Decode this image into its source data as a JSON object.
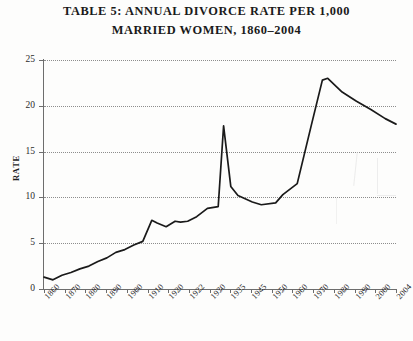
{
  "figure": {
    "title_line1": "Table 5: Annual Divorce Rate per 1,000",
    "title_line2": "Married Women, 1860–2004",
    "ylabel": "Rate"
  },
  "chart_data": {
    "type": "line",
    "title": "Table 5: Annual Divorce Rate per 1,000 Married Women, 1860–2004",
    "subtitle": "",
    "xlabel": "",
    "ylabel": "Rate",
    "ylim": [
      0,
      25
    ],
    "yticks": [
      0,
      5,
      10,
      15,
      20,
      25
    ],
    "ytick_labels": [
      "0",
      "5",
      "10",
      "15",
      "20",
      "25"
    ],
    "grid": true,
    "grid_style": "dotted horizontal",
    "legend": false,
    "legend_position": "none",
    "line_color": "#1a1a1a",
    "xtick_labels": [
      "1860",
      "1870",
      "1880",
      "1890",
      "1900",
      "1910",
      "1920",
      "1922",
      "1930",
      "1935",
      "1945",
      "1950",
      "1960",
      "1970",
      "1980",
      "1990",
      "2000",
      "2004"
    ],
    "categories": [
      "1860",
      "1865",
      "1870",
      "1875",
      "1880",
      "1885",
      "1890",
      "1895",
      "1900",
      "1905",
      "1910",
      "1915",
      "1920",
      "1922",
      "1925",
      "1928",
      "1930",
      "1932",
      "1935",
      "1940",
      "1944",
      "1946",
      "1948",
      "1950",
      "1955",
      "1958",
      "1962",
      "1965",
      "1970",
      "1975",
      "1979",
      "1981",
      "1985",
      "1990",
      "1995",
      "2000",
      "2004"
    ],
    "x_positions": [
      0,
      10,
      20,
      30,
      40,
      50,
      60,
      70,
      80,
      90,
      100,
      110,
      120,
      126,
      136,
      146,
      152,
      160,
      170,
      182,
      194,
      200,
      208,
      216,
      232,
      242,
      258,
      266,
      282,
      298,
      310,
      316,
      332,
      348,
      364,
      380,
      392
    ],
    "values": [
      1.3,
      1.0,
      1.5,
      1.8,
      2.2,
      2.5,
      3.0,
      3.4,
      4.0,
      4.3,
      4.8,
      5.2,
      7.5,
      7.2,
      6.8,
      7.4,
      7.3,
      7.4,
      7.9,
      8.8,
      9.0,
      17.8,
      11.2,
      10.2,
      9.5,
      9.2,
      9.4,
      10.3,
      11.5,
      18.0,
      22.8,
      23.0,
      21.5,
      20.5,
      19.6,
      18.6,
      18.0
    ],
    "annotations": []
  }
}
